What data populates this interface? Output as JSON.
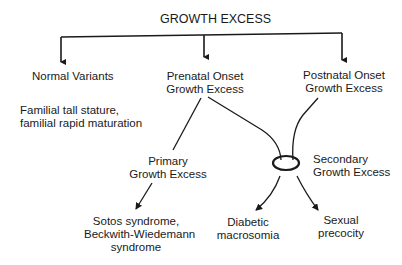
{
  "title": "GROWTH EXCESS",
  "nodes": {
    "normal_variants": {
      "label": "Normal Variants"
    },
    "normal_examples": {
      "line1": "Familial tall stature,",
      "line2": "familial rapid maturation"
    },
    "prenatal": {
      "line1": "Prenatal Onset",
      "line2": "Growth Excess"
    },
    "postnatal": {
      "line1": "Postnatal Onset",
      "line2": "Growth Excess"
    },
    "primary": {
      "line1": "Primary",
      "line2": "Growth Excess"
    },
    "secondary": {
      "line1": "Secondary",
      "line2": "Growth Excess"
    },
    "sotos": {
      "line1": "Sotos syndrome,",
      "line2": "Beckwith-Wiedemann",
      "line3": "syndrome"
    },
    "diabetic": {
      "line1": "Diabetic",
      "line2": "macrosomia"
    },
    "sexual": {
      "line1": "Sexual",
      "line2": "precocity"
    }
  },
  "colors": {
    "line": "#1a1a1a",
    "text": "#1a1a1a",
    "background": "#ffffff"
  }
}
